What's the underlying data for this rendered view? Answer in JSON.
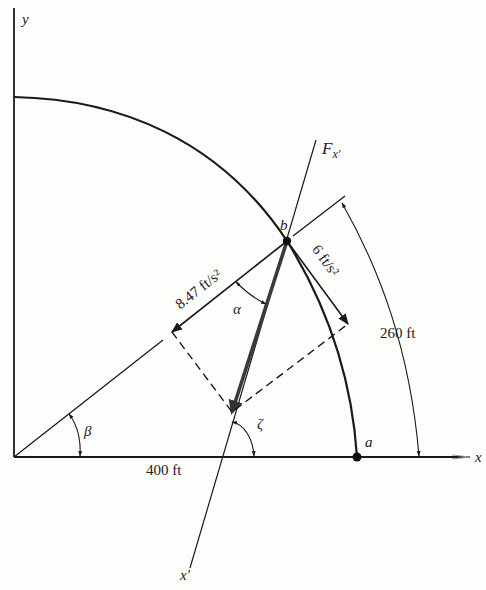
{
  "axes": {
    "x_label": "x",
    "y_label": "y",
    "x_prime_label": "x'",
    "force_label": "F",
    "force_subscript": "x'"
  },
  "points": {
    "a": "a",
    "b": "b"
  },
  "angles": {
    "alpha": "α",
    "beta": "β",
    "zeta": "ζ"
  },
  "dimensions": {
    "horizontal": "400 ft",
    "arc": "260 ft"
  },
  "accelerations": {
    "radial": "8.47 ft/s²",
    "tangential": "6 ft/s²"
  },
  "colors": {
    "line": "#1a1a1a",
    "background": "#fdfdfc"
  }
}
